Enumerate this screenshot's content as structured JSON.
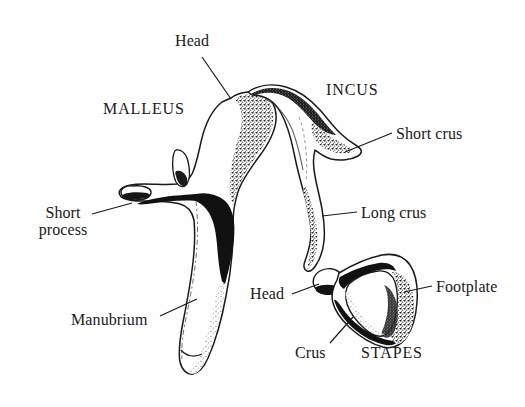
{
  "figure": {
    "background_color": "#fefefe",
    "ink_color": "#1a1a1a",
    "shading_color": "#2b2b2b"
  },
  "labels": {
    "malleus_head": "Head",
    "malleus_name": "MALLEUS",
    "incus_name": "INCUS",
    "short_crus": "Short crus",
    "long_crus": "Long crus",
    "short_process_line1": "Short",
    "short_process_line2": "process",
    "manubrium": "Manubrium",
    "stapes_head": "Head",
    "footplate": "Footplate",
    "crus": "Crus",
    "stapes_name": "STAPES"
  },
  "structures": [
    {
      "name": "malleus",
      "parts": [
        "Head",
        "Short process",
        "Manubrium"
      ]
    },
    {
      "name": "incus",
      "parts": [
        "Short crus",
        "Long crus"
      ]
    },
    {
      "name": "stapes",
      "parts": [
        "Head",
        "Crus",
        "Footplate"
      ]
    }
  ],
  "leader_lines": [
    {
      "label": "Head",
      "belongs_to": "malleus",
      "from": [
        202,
        57
      ],
      "to": [
        231,
        98
      ]
    },
    {
      "label": "Short crus",
      "belongs_to": "incus",
      "from": [
        392,
        133
      ],
      "to": [
        345,
        152
      ]
    },
    {
      "label": "Long crus",
      "belongs_to": "incus",
      "from": [
        357,
        212
      ],
      "to": [
        323,
        216
      ]
    },
    {
      "label": "Short process",
      "belongs_to": "malleus",
      "from": [
        92,
        213
      ],
      "to": [
        133,
        203
      ]
    },
    {
      "label": "Manubrium",
      "belongs_to": "malleus",
      "from": [
        160,
        316
      ],
      "to": [
        196,
        299
      ]
    },
    {
      "label": "Head",
      "belongs_to": "stapes",
      "from": [
        292,
        293
      ],
      "to": [
        320,
        283
      ]
    },
    {
      "label": "Footplate",
      "belongs_to": "stapes",
      "from": [
        432,
        285
      ],
      "to": [
        405,
        291
      ]
    },
    {
      "label": "Crus",
      "belongs_to": "stapes",
      "from": [
        330,
        343
      ],
      "to": [
        352,
        318
      ]
    }
  ]
}
